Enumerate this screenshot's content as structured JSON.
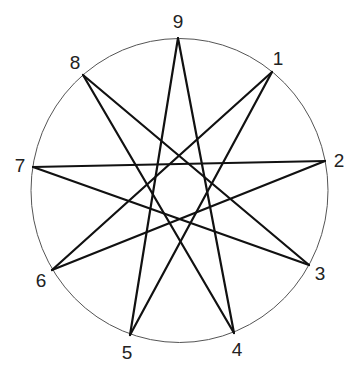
{
  "diagram": {
    "circle": {
      "cx": 179.5,
      "cy": 190.5,
      "rx": 148.5,
      "ry": 152,
      "stroke": "#555555"
    },
    "line_color": "#111111",
    "points": [
      {
        "id": "1",
        "x": 272,
        "y": 72,
        "label_x": 278,
        "label_y": 58
      },
      {
        "id": "2",
        "x": 325,
        "y": 161,
        "label_x": 339,
        "label_y": 160
      },
      {
        "id": "3",
        "x": 309,
        "y": 265,
        "label_x": 320,
        "label_y": 273
      },
      {
        "id": "4",
        "x": 234,
        "y": 333,
        "label_x": 237,
        "label_y": 349
      },
      {
        "id": "5",
        "x": 130,
        "y": 335,
        "label_x": 127,
        "label_y": 352
      },
      {
        "id": "6",
        "x": 52,
        "y": 270,
        "label_x": 41,
        "label_y": 280
      },
      {
        "id": "7",
        "x": 33,
        "y": 167,
        "label_x": 20,
        "label_y": 165
      },
      {
        "id": "8",
        "x": 83,
        "y": 75,
        "label_x": 75,
        "label_y": 62
      },
      {
        "id": "9",
        "x": 178,
        "y": 38,
        "label_x": 178,
        "label_y": 21
      }
    ],
    "path_order": [
      "9",
      "4",
      "8",
      "3",
      "7",
      "2",
      "6",
      "1",
      "5",
      "9"
    ],
    "edges": [
      [
        "9",
        "4"
      ],
      [
        "4",
        "8"
      ],
      [
        "8",
        "3"
      ],
      [
        "3",
        "7"
      ],
      [
        "7",
        "2"
      ],
      [
        "2",
        "6"
      ],
      [
        "6",
        "1"
      ],
      [
        "1",
        "5"
      ],
      [
        "5",
        "9"
      ]
    ]
  }
}
